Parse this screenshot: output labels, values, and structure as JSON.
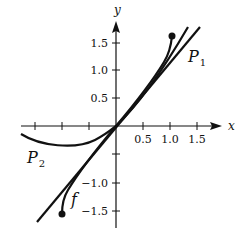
{
  "diagram": {
    "axes": {
      "x_label": "x",
      "y_label": "y",
      "x_ticks": [
        {
          "value": -1.5,
          "label": ""
        },
        {
          "value": -1.0,
          "label": ""
        },
        {
          "value": -0.5,
          "label": ""
        },
        {
          "value": 0.5,
          "label": "0.5"
        },
        {
          "value": 1.0,
          "label": "1.0"
        },
        {
          "value": 1.5,
          "label": "1.5"
        }
      ],
      "y_ticks": [
        {
          "value": 1.5,
          "label": "1.5"
        },
        {
          "value": 1.0,
          "label": "1.0"
        },
        {
          "value": 0.5,
          "label": "0.5"
        },
        {
          "value": -0.5,
          "label": ""
        },
        {
          "value": -1.0,
          "label": "−1.0"
        },
        {
          "value": -1.5,
          "label": "−1.5"
        }
      ]
    },
    "curves": {
      "f": {
        "label": "f",
        "description": "function with closed endpoints near (-1, -1.57) and (1, 1.57)"
      },
      "p1": {
        "label": "P",
        "subscript": "1",
        "description": "straight line through origin"
      },
      "p2": {
        "label": "P",
        "subscript": "2",
        "description": "curve dipping below x-axis on the left, tangent at origin"
      }
    },
    "colors": {
      "stroke": "#111111",
      "background": "#ffffff"
    }
  }
}
